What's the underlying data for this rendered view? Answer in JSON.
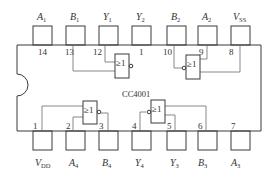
{
  "chip": {
    "name": "CC4001"
  },
  "top_pins": [
    {
      "number": "14",
      "label": "A",
      "sub": "1"
    },
    {
      "number": "13",
      "label": "B",
      "sub": "1"
    },
    {
      "number": "12",
      "label": "Y",
      "sub": "1"
    },
    {
      "number": "1",
      "label": "Y",
      "sub": "2"
    },
    {
      "number": "10",
      "label": "B",
      "sub": "2"
    },
    {
      "number": "9",
      "label": "A",
      "sub": "2"
    },
    {
      "number": "8",
      "label": "V",
      "sub": "SS"
    }
  ],
  "bottom_pins": [
    {
      "number": "1",
      "label": "V",
      "sub": "DD"
    },
    {
      "number": "2",
      "label": "A",
      "sub": "4"
    },
    {
      "number": "3",
      "label": "B",
      "sub": "4"
    },
    {
      "number": "4",
      "label": "Y",
      "sub": "4"
    },
    {
      "number": "5",
      "label": "Y",
      "sub": "3"
    },
    {
      "number": "6",
      "label": "B",
      "sub": "3"
    },
    {
      "number": "7",
      "label": "A",
      "sub": "3"
    }
  ],
  "gates": [
    {
      "id": "gate-1",
      "symbol": "≥1"
    },
    {
      "id": "gate-2",
      "symbol": "≥1"
    },
    {
      "id": "gate-3",
      "symbol": "≥1"
    },
    {
      "id": "gate-4",
      "symbol": "≥1"
    }
  ]
}
